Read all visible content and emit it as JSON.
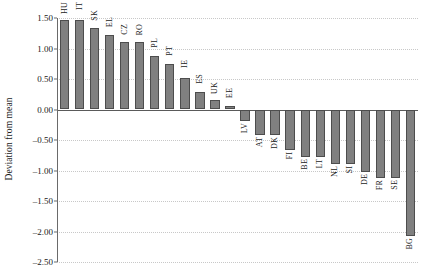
{
  "chart_data": {
    "type": "bar",
    "title": "",
    "subtitle": "",
    "xlabel": "",
    "ylabel": "Deviation from mean",
    "ylim": [
      -2.5,
      1.5
    ],
    "xlim": [
      0,
      24
    ],
    "grid": true,
    "grid_style": "dotted horizontal",
    "legend": "none",
    "orientation": "vertical",
    "bar_color": "#808080",
    "bar_edge_color": "#4d4d4d",
    "zero_line_color": "#5a5a5a",
    "gridline_color": "#c8c8c8",
    "tick_labels": [
      "1.50",
      "1.00",
      "0.50",
      "0.00",
      "-0.50",
      "-1.00",
      "-1.50",
      "-2.00",
      "-2.50"
    ],
    "tick_values": [
      1.5,
      1.0,
      0.5,
      0.0,
      -0.5,
      -1.0,
      -1.5,
      -2.0,
      -2.5
    ],
    "categories": [
      "HU",
      "IT",
      "SK",
      "EL",
      "CZ",
      "RO",
      "PL",
      "PT",
      "IE",
      "ES",
      "UK",
      "EE",
      "LV",
      "AT",
      "DK",
      "FI",
      "BE",
      "LT",
      "NL",
      "SI",
      "DE",
      "FR",
      "SE",
      "BG"
    ],
    "values": [
      1.46,
      1.46,
      1.34,
      1.22,
      1.1,
      1.1,
      0.87,
      0.74,
      0.51,
      0.28,
      0.16,
      0.05,
      -0.19,
      -0.42,
      -0.42,
      -0.66,
      -0.78,
      -0.78,
      -0.89,
      -0.89,
      -1.02,
      -1.13,
      -1.13,
      -2.07
    ]
  }
}
